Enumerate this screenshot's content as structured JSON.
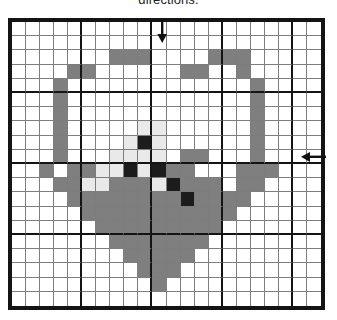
{
  "caption": {
    "text": "directions."
  },
  "chart_data": {
    "type": "heatmap",
    "xlabel": "",
    "ylabel": "",
    "grid": true,
    "columns": 22,
    "rows": 20,
    "heavy_rule_every": 5,
    "legend": [
      {
        "key": "W",
        "label": "empty",
        "color": "#ffffff"
      },
      {
        "key": "G",
        "label": "medium gray floss",
        "color": "#7f7f7f"
      },
      {
        "key": "L",
        "label": "light gray floss",
        "color": "#e9e9e9"
      },
      {
        "key": "K",
        "label": "black floss",
        "color": "#1c1c1c"
      }
    ],
    "cells": [
      "WWWWWWWWWWWWWWWWWWWWWW",
      "WWWWWWWWWWWWWWWWWWWWWW",
      "WWWWWWWGGGWWWWGGGWWWWW",
      "WWWWGGWWWWWWGGWWGWWWWW",
      "WWWGWWWWWWWWWWWWWGWWWW",
      "WWWGWWWWWWWWWWWWWGWWWW",
      "WWWGWWWWWWWWWWWWWGWWWW",
      "WWWGWWWWWLLWWWWWWGWWWW",
      "WWWGWWWWLKLWWWWWWGWWWW",
      "WWWGWWWLLLLWGGWWWGWWWW",
      "WWGWGGLLKLKGGWWWGGGWWW",
      "WWWGGLLGGGLKGGGWGGWWWW",
      "WWWWGGGGGGGGKGGGGWWWWW",
      "WWWWWGGGGGGGGGGGWWWWWW",
      "WWWWWWGGGGGGGGGWWWWWWW",
      "WWWWWWWGGGGGGGWWWWWWWW",
      "WWWWWWWWGGGGGWWWWWWWWW",
      "WWWWWWWWWGGGWWWWWWWWWW",
      "WWWWWWWWWWGWWWWWWWWWWW",
      "WWWWWWWWWWWWWWWWWWWWWW"
    ]
  },
  "annotations": {
    "arrow_top": {
      "name": "center-column-marker",
      "direction": "down"
    },
    "arrow_right": {
      "name": "center-row-marker",
      "direction": "left"
    }
  }
}
